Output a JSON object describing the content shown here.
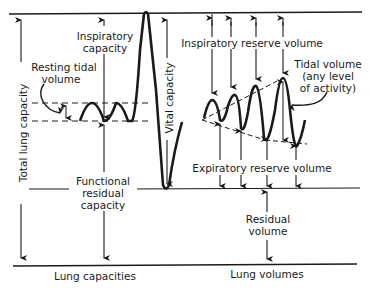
{
  "diagram": {
    "type": "lung volumes and capacities spirogram",
    "colors": {
      "ink": "#1a1a1a",
      "background": "#ffffff"
    },
    "labels": {
      "total_lung_capacity": "Total lung capacity",
      "inspiratory_capacity_line1": "Inspiratory",
      "inspiratory_capacity_line2": "capacity",
      "resting_tidal_line1": "Resting tidal",
      "resting_tidal_line2": "volume",
      "vital_capacity": "Vital capacity",
      "inspiratory_reserve_volume": "Inspiratory reserve volume",
      "tidal_volume_line1": "Tidal volume",
      "tidal_volume_line2": "(any level",
      "tidal_volume_line3": "of activity)",
      "expiratory_reserve_volume": "Expiratory reserve volume",
      "frc_line1": "Functional",
      "frc_line2": "residual",
      "frc_line3": "capacity",
      "residual_line1": "Residual",
      "residual_line2": "volume",
      "lung_capacities": "Lung capacities",
      "lung_volumes": "Lung volumes"
    },
    "sections": [
      "Lung capacities",
      "Lung volumes"
    ],
    "levels": [
      "Total lung capacity (top)",
      "Resting end-inspiration",
      "Resting end-expiration (FRC)",
      "Residual volume level",
      "Zero (bottom)"
    ]
  }
}
